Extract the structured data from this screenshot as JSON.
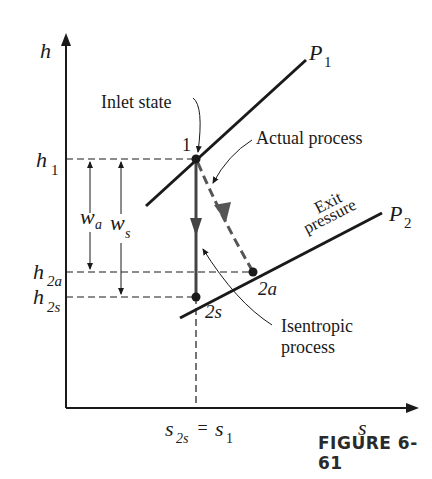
{
  "figure": {
    "caption": "FIGURE 6-61",
    "type": "h-s diagram (turbine isentropic vs actual expansion)"
  },
  "axes": {
    "y_label": "h",
    "x_label": "s",
    "x_tick_label_main": "s",
    "x_tick_label_main_sub": "2s",
    "x_tick_label_eq": " = ",
    "x_tick_label_rhs": "s",
    "x_tick_label_rhs_sub": "1"
  },
  "y_levels": [
    {
      "name": "h1",
      "base": "h",
      "sub": "1"
    },
    {
      "name": "h2a",
      "base": "h",
      "sub": "2a"
    },
    {
      "name": "h2s",
      "base": "h",
      "sub": "2s"
    }
  ],
  "pressure_lines": {
    "p1": {
      "base": "P",
      "sub": "1"
    },
    "p2": {
      "base": "P",
      "sub": "2"
    }
  },
  "points": {
    "state1": "1",
    "state2s": "2s",
    "state2a": "2a"
  },
  "work_labels": {
    "wa": {
      "base": "w",
      "sub": "a"
    },
    "ws": {
      "base": "w",
      "sub": "s"
    }
  },
  "annotations": {
    "inlet_state": "Inlet state",
    "actual_process": "Actual process",
    "exit_line1": "Exit",
    "exit_line2": "pressure",
    "isentropic_line1": "Isentropic",
    "isentropic_line2": "process"
  },
  "colors": {
    "ink": "#1a1a1a",
    "arrow_gray": "#555555"
  }
}
